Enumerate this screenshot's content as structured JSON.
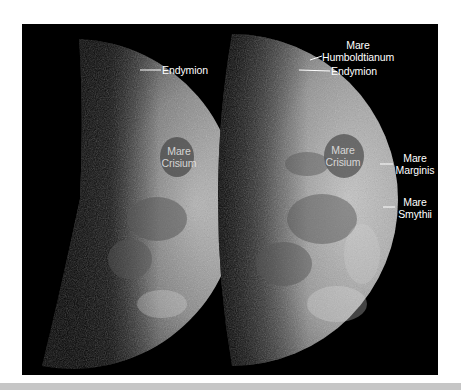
{
  "figure": {
    "background_color": "#000000",
    "label_color": "#ffffff",
    "bottom_bar_color": "#c6c6c6",
    "panels": [
      {
        "name": "left-moon",
        "labels": [
          {
            "id": "endymion",
            "lines": [
              "Endymion"
            ]
          },
          {
            "id": "mare-crisium",
            "lines": [
              "Mare",
              "Crisium"
            ]
          }
        ]
      },
      {
        "name": "right-moon",
        "labels": [
          {
            "id": "mare-humboldtianum",
            "lines": [
              "Mare",
              "Humboldtianum"
            ]
          },
          {
            "id": "endymion",
            "lines": [
              "Endymion"
            ]
          },
          {
            "id": "mare-crisium",
            "lines": [
              "Mare",
              "Crisium"
            ]
          },
          {
            "id": "mare-marginis",
            "lines": [
              "Mare",
              "Marginis"
            ]
          },
          {
            "id": "mare-smythii",
            "lines": [
              "Mare",
              "Smythii"
            ]
          }
        ]
      }
    ]
  }
}
